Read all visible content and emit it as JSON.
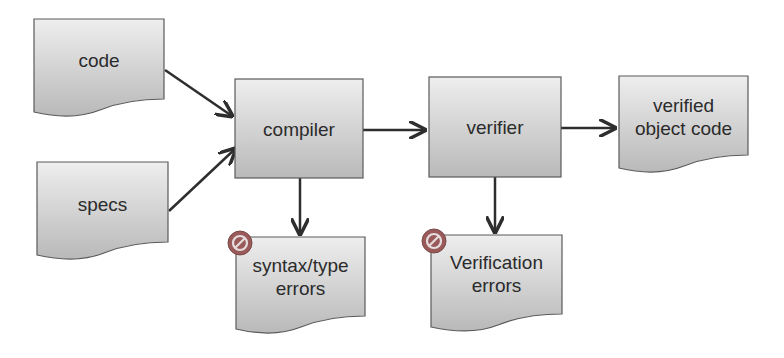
{
  "diagram": {
    "type": "flowchart",
    "nodes": [
      {
        "id": "code",
        "shape": "document",
        "label": "code"
      },
      {
        "id": "specs",
        "shape": "document",
        "label": "specs"
      },
      {
        "id": "compiler",
        "shape": "process",
        "label": "compiler"
      },
      {
        "id": "verifier",
        "shape": "process",
        "label": "verifier"
      },
      {
        "id": "verified_object_code",
        "shape": "document",
        "label": "verified\nobject code"
      },
      {
        "id": "syntax_type_errors",
        "shape": "document",
        "label": "syntax/type\nerrors",
        "icon": "error-no-entry-icon"
      },
      {
        "id": "verification_errors",
        "shape": "document",
        "label": "Verification\nerrors",
        "icon": "error-no-entry-icon"
      }
    ],
    "edges": [
      {
        "from": "code",
        "to": "compiler"
      },
      {
        "from": "specs",
        "to": "compiler"
      },
      {
        "from": "compiler",
        "to": "verifier"
      },
      {
        "from": "verifier",
        "to": "verified_object_code"
      },
      {
        "from": "compiler",
        "to": "syntax_type_errors"
      },
      {
        "from": "verifier",
        "to": "verification_errors"
      }
    ],
    "colors": {
      "fill_light": "#ececec",
      "fill_dark": "#b8b8b8",
      "stroke": "#5a5a5a",
      "arrow": "#2e2e2e",
      "error_icon": "#9a5a5a"
    }
  }
}
